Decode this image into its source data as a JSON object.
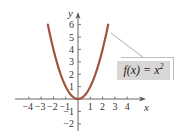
{
  "chart_data": {
    "type": "line",
    "title": "",
    "function": "f(x) = x^2",
    "xlabel": "x",
    "ylabel": "y",
    "xlim": [
      -4.5,
      4.5
    ],
    "ylim": [
      -2.5,
      6.5
    ],
    "x_ticks": [
      -4,
      -3,
      -2,
      -1,
      1,
      2,
      3,
      4
    ],
    "x_tick_labels": [
      "−4",
      "−3",
      "−2",
      "−1",
      "1",
      "2",
      "3",
      "4"
    ],
    "y_ticks": [
      -2,
      -1,
      1,
      2,
      3,
      4,
      5,
      6
    ],
    "y_tick_labels": [
      "−2",
      "−1",
      "1",
      "2",
      "3",
      "4",
      "5",
      "6"
    ],
    "grid": false,
    "legend": "none",
    "series": [
      {
        "name": "f(x) = x²",
        "color": "#a0533f",
        "x": [
          -2.45,
          -2,
          -1.5,
          -1,
          -0.5,
          0,
          0.5,
          1,
          1.5,
          2,
          2.45
        ],
        "y": [
          6.0,
          4.0,
          2.25,
          1.0,
          0.25,
          0.0,
          0.25,
          1.0,
          2.25,
          4.0,
          6.0
        ]
      }
    ],
    "annotations": [
      {
        "text": "f(x) = x²",
        "points_to": [
          2.3,
          5.3
        ],
        "style": "gray box with leader line"
      }
    ]
  },
  "labels": {
    "x_axis": "x",
    "y_axis": "y",
    "annotation_main": "f(x) = x",
    "annotation_exp": "2"
  },
  "colors": {
    "curve": "#a0533f",
    "axis": "#555555",
    "annotation_fill": "#d9d7d6"
  }
}
